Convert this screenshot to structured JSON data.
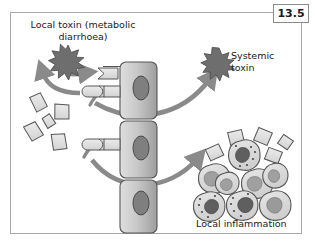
{
  "figure": {
    "number": "13.5",
    "border_color": "#a8a8a8",
    "background": "#ffffff"
  },
  "labels": {
    "local_toxin": "Local toxin (metabolic\ndiarrhoea)",
    "local_toxin_line1": "Local toxin (metabolic",
    "local_toxin_line2": "diarrhoea)",
    "systemic_toxin": "Systemic\ntoxin",
    "systemic_toxin_line1": "Systemic",
    "systemic_toxin_line2": "toxin",
    "local_inflammation": "Local inflammation"
  },
  "palette": {
    "outline": "#4d4d4d",
    "arrow": "#8a8a8a",
    "bacteria_fill": "#e0e0e0",
    "epithelium_light": "#d4d4d4",
    "epithelium_dark": "#9a9a9a",
    "nucleus": "#7a7a7a",
    "nucleus_dark": "#5a5a5a",
    "toxin_star": "#6e6e6e",
    "immune_cell_fill": "#dcdcdc",
    "granulocyte_nucleus": "#6a6a6a",
    "macrophage_nucleus": "#9e9e9e",
    "text": "#1a1a1a"
  },
  "elements": {
    "epithelial_cells": [
      {
        "name": "epithelial-cell-top",
        "nucleus": true
      },
      {
        "name": "epithelial-cell-middle",
        "nucleus": true
      },
      {
        "name": "epithelial-cell-bottom",
        "nucleus": true
      }
    ],
    "free_bacteria_count": 5,
    "adherent_bacteria_count": 3,
    "immune_cells_count": 8,
    "inflammation_bacteria_count": 5,
    "toxin_starbursts": [
      {
        "name": "local-toxin-starburst"
      },
      {
        "name": "systemic-toxin-starburst"
      }
    ],
    "arrows": [
      {
        "name": "arrow-to-local-toxin"
      },
      {
        "name": "arrow-bacteria-to-epithelium-upper"
      },
      {
        "name": "arrow-bacteria-to-epithelium-lower"
      },
      {
        "name": "arrow-to-systemic-toxin"
      },
      {
        "name": "arrow-to-local-inflammation"
      }
    ]
  }
}
